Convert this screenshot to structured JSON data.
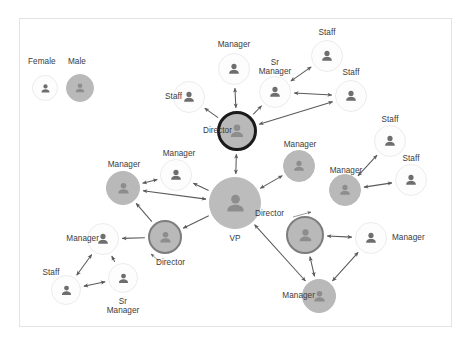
{
  "diagram": {
    "frame": {
      "x": 19,
      "y": 18,
      "w": 433,
      "h": 309,
      "border_color": "#e3e3e3"
    },
    "colors": {
      "female_fill": "#fdfdfd",
      "female_stroke": "#ececec",
      "male_fill": "#b9b9b9",
      "male_stroke": "#b9b9b9",
      "icon_on_light": "#6e6e6e",
      "icon_on_dark": "#8d8d8d",
      "vp_fill": "#bcbcbc",
      "director_top_stroke": "#1a1a1a",
      "director_ring_stroke": "#7d7d7d",
      "edge_color": "#5a5a5a",
      "label_color": "#3b3b3b"
    },
    "legend": {
      "items": [
        {
          "id": "legend-female",
          "label": "Female",
          "gender": "female",
          "cx": 45,
          "cy": 88,
          "r": 13,
          "label_x": 28,
          "label_y": 57
        },
        {
          "id": "legend-male",
          "label": "Male",
          "gender": "male",
          "cx": 80,
          "cy": 88,
          "r": 14,
          "label_x": 68,
          "label_y": 57
        }
      ]
    },
    "nodes": [
      {
        "id": "n-director-top",
        "label": "Director",
        "role": "Director",
        "gender": "male",
        "style": "director-bold",
        "cx": 237,
        "cy": 131,
        "r": 20,
        "label_x": 176,
        "label_y": 126,
        "label_align": "r",
        "label_w": 56
      },
      {
        "id": "n-manager-top",
        "label": "Manager",
        "role": "Manager",
        "gender": "female",
        "style": "plain",
        "cx": 234,
        "cy": 69,
        "r": 16,
        "label_x": 206,
        "label_y": 40,
        "label_align": "c",
        "label_w": 56
      },
      {
        "id": "n-staff-topleft",
        "label": "Staff",
        "role": "Staff",
        "gender": "female",
        "style": "plain",
        "cx": 189,
        "cy": 97,
        "r": 16,
        "label_x": 142,
        "label_y": 92,
        "label_align": "r",
        "label_w": 40
      },
      {
        "id": "n-srmanager-top",
        "label": "Sr\nManager",
        "role": "Sr Manager",
        "gender": "female",
        "style": "plain",
        "cx": 275,
        "cy": 92,
        "r": 16,
        "label_x": 254,
        "label_y": 58,
        "label_align": "c",
        "label_w": 42
      },
      {
        "id": "n-staff-topright1",
        "label": "Staff",
        "role": "Staff",
        "gender": "female",
        "style": "plain",
        "cx": 327,
        "cy": 56,
        "r": 16,
        "label_x": 307,
        "label_y": 28,
        "label_align": "c",
        "label_w": 40
      },
      {
        "id": "n-staff-topright2",
        "label": "Staff",
        "role": "Staff",
        "gender": "female",
        "style": "plain",
        "cx": 351,
        "cy": 96,
        "r": 16,
        "label_x": 331,
        "label_y": 68,
        "label_align": "c",
        "label_w": 40
      },
      {
        "id": "n-vp",
        "label": "VP",
        "role": "VP",
        "gender": "male",
        "style": "vp",
        "cx": 235,
        "cy": 203,
        "r": 26,
        "label_x": 215,
        "label_y": 234,
        "label_align": "c",
        "label_w": 40
      },
      {
        "id": "n-manager-midleft",
        "label": "Manager",
        "role": "Manager",
        "gender": "female",
        "style": "plain",
        "cx": 176,
        "cy": 175,
        "r": 16,
        "label_x": 151,
        "label_y": 149,
        "label_align": "c",
        "label_w": 56
      },
      {
        "id": "n-manager-left",
        "label": "Manager",
        "role": "Manager",
        "gender": "male",
        "style": "plain",
        "cx": 123,
        "cy": 188,
        "r": 17,
        "label_x": 96,
        "label_y": 160,
        "label_align": "c",
        "label_w": 56
      },
      {
        "id": "n-director-left",
        "label": "Director",
        "role": "Director",
        "gender": "male",
        "style": "director-ring",
        "cx": 165,
        "cy": 237,
        "r": 17,
        "label_x": 156,
        "label_y": 258,
        "label_align": "l",
        "label_w": 56
      },
      {
        "id": "n-manager-botleft",
        "label": "Manager",
        "role": "Manager",
        "gender": "female",
        "style": "plain",
        "cx": 103,
        "cy": 239,
        "r": 16,
        "label_x": 41,
        "label_y": 234,
        "label_align": "r",
        "label_w": 58
      },
      {
        "id": "n-staff-botleft",
        "label": "Staff",
        "role": "Staff",
        "gender": "female",
        "style": "plain",
        "cx": 66,
        "cy": 290,
        "r": 15,
        "label_x": 31,
        "label_y": 268,
        "label_align": "c",
        "label_w": 40
      },
      {
        "id": "n-srmanager-bot",
        "label": "Sr\nManager",
        "role": "Sr Manager",
        "gender": "female",
        "style": "plain",
        "cx": 123,
        "cy": 278,
        "r": 15,
        "label_x": 102,
        "label_y": 297,
        "label_align": "c",
        "label_w": 42
      },
      {
        "id": "n-manager-midrt",
        "label": "Manager",
        "role": "Manager",
        "gender": "male",
        "style": "plain",
        "cx": 299,
        "cy": 166,
        "r": 16,
        "label_x": 272,
        "label_y": 140,
        "label_align": "c",
        "label_w": 56
      },
      {
        "id": "n-manager-right",
        "label": "Manager",
        "role": "Manager",
        "gender": "male",
        "style": "plain",
        "cx": 345,
        "cy": 190,
        "r": 16,
        "label_x": 318,
        "label_y": 166,
        "label_align": "c",
        "label_w": 56
      },
      {
        "id": "n-staff-right1",
        "label": "Staff",
        "role": "Staff",
        "gender": "female",
        "style": "plain",
        "cx": 390,
        "cy": 141,
        "r": 16,
        "label_x": 370,
        "label_y": 115,
        "label_align": "c",
        "label_w": 40
      },
      {
        "id": "n-staff-right2",
        "label": "Staff",
        "role": "Staff",
        "gender": "female",
        "style": "plain",
        "cx": 411,
        "cy": 180,
        "r": 16,
        "label_x": 391,
        "label_y": 154,
        "label_align": "c",
        "label_w": 40
      },
      {
        "id": "n-director-right",
        "label": "Director",
        "role": "Director",
        "gender": "male",
        "style": "director-ring",
        "cx": 305,
        "cy": 235,
        "r": 19,
        "label_x": 255,
        "label_y": 209,
        "label_align": "l",
        "label_w": 56
      },
      {
        "id": "n-manager-farrt",
        "label": "Manager",
        "role": "Manager",
        "gender": "female",
        "style": "plain",
        "cx": 371,
        "cy": 238,
        "r": 16,
        "label_x": 392,
        "label_y": 233,
        "label_align": "l",
        "label_w": 56
      },
      {
        "id": "n-manager-bottom",
        "label": "Manager",
        "role": "Manager",
        "gender": "male",
        "style": "plain",
        "cx": 319,
        "cy": 296,
        "r": 17,
        "label_x": 257,
        "label_y": 291,
        "label_align": "r",
        "label_w": 58
      }
    ],
    "edges": [
      {
        "id": "e-vp-director-top",
        "from": "n-vp",
        "to": "n-director-top",
        "arrows": "both"
      },
      {
        "id": "e-directortop-managertop",
        "from": "n-director-top",
        "to": "n-manager-top",
        "arrows": "both"
      },
      {
        "id": "e-directortop-staffleft",
        "from": "n-director-top",
        "to": "n-staff-topleft",
        "arrows": "end"
      },
      {
        "id": "e-directortop-srmanager",
        "from": "n-director-top",
        "to": "n-srmanager-top",
        "arrows": "end"
      },
      {
        "id": "e-srmanager-staffr1",
        "from": "n-srmanager-top",
        "to": "n-staff-topright1",
        "arrows": "both"
      },
      {
        "id": "e-srmanager-staffr2",
        "from": "n-srmanager-top",
        "to": "n-staff-topright2",
        "arrows": "both"
      },
      {
        "id": "e-directortop-staffr2",
        "from": "n-staff-topright2",
        "to": "n-director-top",
        "arrows": "both"
      },
      {
        "id": "e-vp-managermidleft",
        "from": "n-vp",
        "to": "n-manager-midleft",
        "arrows": "end"
      },
      {
        "id": "e-managermidleft-left",
        "from": "n-manager-midleft",
        "to": "n-manager-left",
        "arrows": "both"
      },
      {
        "id": "e-vp-managerleft",
        "from": "n-vp",
        "to": "n-manager-left",
        "arrows": "both"
      },
      {
        "id": "e-vp-directorleft",
        "from": "n-vp",
        "to": "n-director-left",
        "arrows": "end"
      },
      {
        "id": "e-directorleft-managerbl",
        "from": "n-director-left",
        "to": "n-manager-botleft",
        "arrows": "end"
      },
      {
        "id": "e-managerleft-directorlf",
        "from": "n-director-left",
        "to": "n-manager-left",
        "arrows": "end"
      },
      {
        "id": "e-srmgrbot-managerbl",
        "from": "n-srmanager-bot",
        "to": "n-manager-botleft",
        "arrows": "end"
      },
      {
        "id": "e-srmgrbot-staffbl",
        "from": "n-srmanager-bot",
        "to": "n-staff-botleft",
        "arrows": "both"
      },
      {
        "id": "e-managerbl-staffbl",
        "from": "n-manager-botleft",
        "to": "n-staff-botleft",
        "arrows": "both"
      },
      {
        "id": "e-vp-managermidrt",
        "from": "n-vp",
        "to": "n-manager-midrt",
        "arrows": "both"
      },
      {
        "id": "e-managerright-staffr1",
        "from": "n-manager-right",
        "to": "n-staff-right1",
        "arrows": "both"
      },
      {
        "id": "e-managerright-staffr2",
        "from": "n-manager-right",
        "to": "n-staff-right2",
        "arrows": "both"
      },
      {
        "id": "e-directorrt-managerfar",
        "from": "n-director-right",
        "to": "n-manager-farrt",
        "arrows": "both"
      },
      {
        "id": "e-directorrt-managerbot",
        "from": "n-director-right",
        "to": "n-manager-bottom",
        "arrows": "both"
      },
      {
        "id": "e-managerfar-managerbot",
        "from": "n-manager-farrt",
        "to": "n-manager-bottom",
        "arrows": "both"
      },
      {
        "id": "e-vp-managerbottom",
        "from": "n-vp",
        "to": "n-manager-bottom",
        "arrows": "both"
      }
    ],
    "pointers": [
      {
        "id": "p-director-right-pointer",
        "x1": 293,
        "y1": 217,
        "x2": 311,
        "y2": 212
      },
      {
        "id": "p-director-left-pointer",
        "x1": 160,
        "y1": 262,
        "x2": 151,
        "y2": 254
      }
    ]
  }
}
